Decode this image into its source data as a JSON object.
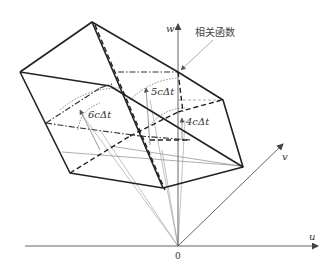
{
  "diagram": {
    "axes": {
      "u": {
        "label": "u"
      },
      "v": {
        "label": "v"
      },
      "w": {
        "label": "w"
      },
      "origin": {
        "label": "0"
      }
    },
    "annotations": {
      "correlation_function": "相关函数",
      "d6": "6cΔt",
      "d5": "5cΔt",
      "d4": "4cΔt"
    },
    "colors": {
      "outline": "#222222",
      "axis": "#555555",
      "thin": "#777777",
      "background": "#ffffff"
    }
  }
}
